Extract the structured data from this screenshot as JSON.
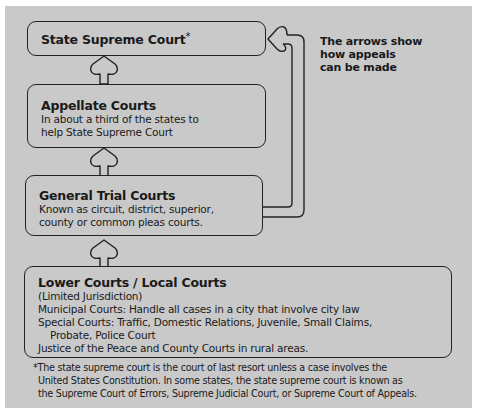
{
  "diagram": {
    "boxes": {
      "supreme": {
        "title": "State Supreme Court",
        "marker": "*"
      },
      "appellate": {
        "title": "Appellate Courts",
        "lines": [
          "In about a third of the states to",
          "help State Supreme Court"
        ]
      },
      "trial": {
        "title": "General Trial Courts",
        "lines": [
          "Known as circuit, district, superior,",
          "county or common pleas courts."
        ]
      },
      "lower": {
        "title": "Lower Courts / Local Courts",
        "lines": [
          "(Limited Jurisdiction)",
          "Municipal Courts: Handle all cases in a city that involve city law",
          "Special Courts: Traffic, Domestic Relations, Juvenile, Small Claims,",
          "Probate, Police Court",
          "Justice of the Peace and County Courts in rural areas."
        ]
      }
    },
    "note": {
      "lines": [
        "The arrows show",
        "how appeals",
        "can be made"
      ]
    },
    "footnote": {
      "lines": [
        "*The state supreme court is the court of last resort unless a case involves the",
        "United States Constitution. In some states, the state supreme court is known as",
        "the Supreme Court of Errors, Supreme Judicial Court, or Supreme Court of Appeals."
      ]
    },
    "colors": {
      "panel": "#c9c9c9",
      "stroke": "#222222",
      "background": "#ffffff"
    },
    "arrows": [
      {
        "from": "lower",
        "to": "trial",
        "icon": "up-arrow-icon"
      },
      {
        "from": "trial",
        "to": "appellate",
        "icon": "up-arrow-icon"
      },
      {
        "from": "appellate",
        "to": "supreme",
        "icon": "up-arrow-icon"
      },
      {
        "from": "trial",
        "to": "supreme",
        "icon": "return-arrow-icon"
      }
    ]
  }
}
